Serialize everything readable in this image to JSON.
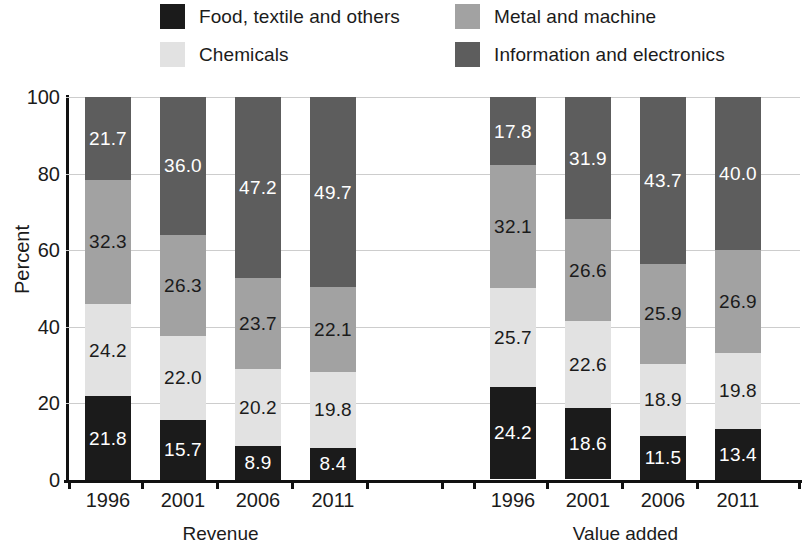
{
  "legend": {
    "items": [
      {
        "label": "Food, textile and others",
        "key": "food",
        "color": "#1b1b1b"
      },
      {
        "label": "Chemicals",
        "key": "chemicals",
        "color": "#e2e2e2"
      },
      {
        "label": "Metal and machine",
        "key": "metal",
        "color": "#a2a2a2"
      },
      {
        "label": "Information and electronics",
        "key": "information",
        "color": "#5d5d5d"
      }
    ]
  },
  "axes": {
    "ylabel": "Percent",
    "yticks": [
      "0",
      "20",
      "40",
      "60",
      "80",
      "100"
    ],
    "ymin": 0,
    "ymax": 100
  },
  "groups": [
    {
      "label": "Revenue",
      "categories": [
        "1996",
        "2001",
        "2006",
        "2011"
      ]
    },
    {
      "label": "Value added",
      "categories": [
        "1996",
        "2001",
        "2006",
        "2011"
      ]
    }
  ],
  "chart_data": {
    "type": "bar",
    "subtype": "stacked-percent",
    "title": "",
    "xlabel": "",
    "ylabel": "Percent",
    "ylim": [
      0,
      100
    ],
    "yticks": [
      0,
      20,
      40,
      60,
      80,
      100
    ],
    "grid": true,
    "legend_position": "top",
    "group_labels": [
      "Revenue",
      "Value added"
    ],
    "categories": [
      "1996",
      "2001",
      "2006",
      "2011",
      "1996",
      "2001",
      "2006",
      "2011"
    ],
    "series": [
      {
        "name": "Food, textile and others",
        "color": "#1b1b1b",
        "values": [
          21.8,
          15.7,
          8.9,
          8.4,
          24.2,
          18.6,
          11.5,
          13.4
        ]
      },
      {
        "name": "Chemicals",
        "color": "#e2e2e2",
        "values": [
          24.2,
          22.0,
          20.2,
          19.8,
          25.7,
          22.6,
          18.9,
          19.8
        ]
      },
      {
        "name": "Metal and machine",
        "color": "#a2a2a2",
        "values": [
          32.3,
          26.3,
          23.7,
          22.1,
          32.1,
          26.6,
          25.9,
          26.9
        ]
      },
      {
        "name": "Information and electronics",
        "color": "#5d5d5d",
        "values": [
          21.7,
          36.0,
          47.2,
          49.7,
          17.8,
          31.9,
          43.7,
          40.0
        ]
      }
    ]
  }
}
